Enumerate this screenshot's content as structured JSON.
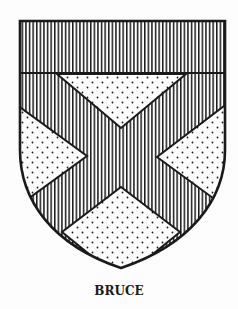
{
  "figure": {
    "caption": "BRUCE",
    "charges": {
      "chief": "vertical-hatching",
      "saltire": "vertical-hatching",
      "field": "dotted"
    }
  },
  "colors": {
    "ink": "#1a1a1a",
    "paper": "#fdfdfd"
  }
}
